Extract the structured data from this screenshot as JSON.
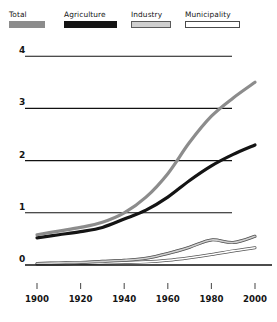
{
  "legend": {
    "items": [
      {
        "label": "Total",
        "swatch": "gray-filled-swatch",
        "color": "#8c8c8c"
      },
      {
        "label": "Agriculture",
        "swatch": "black-filled-swatch",
        "color": "#141414"
      },
      {
        "label": "Industry",
        "swatch": "light-gray-filled-swatch",
        "color": "#cfcfcf"
      },
      {
        "label": "Municipality",
        "swatch": "white-outlined-swatch",
        "color": "#ffffff"
      }
    ]
  },
  "axes": {
    "y_ticks": [
      "0",
      "1",
      "2",
      "3",
      "4"
    ],
    "x_ticks": [
      "1900",
      "1920",
      "1940",
      "1960",
      "1980",
      "2000"
    ]
  },
  "chart_data": {
    "type": "line",
    "title": "",
    "subtitle": "",
    "xlabel": "",
    "ylabel": "",
    "xlim": [
      1900,
      2000
    ],
    "ylim": [
      0,
      4
    ],
    "grid": true,
    "legend_position": "top",
    "x": [
      1900,
      1910,
      1920,
      1930,
      1940,
      1950,
      1960,
      1970,
      1980,
      1990,
      2000
    ],
    "series": [
      {
        "name": "Total",
        "color": "#8c8c8c",
        "values": [
          0.58,
          0.65,
          0.72,
          0.82,
          1.0,
          1.3,
          1.75,
          2.35,
          2.85,
          3.2,
          3.5
        ]
      },
      {
        "name": "Agriculture",
        "color": "#141414",
        "values": [
          0.52,
          0.58,
          0.64,
          0.72,
          0.88,
          1.05,
          1.3,
          1.62,
          1.9,
          2.12,
          2.3
        ]
      },
      {
        "name": "Industry",
        "color": "#cfcfcf",
        "values": [
          0.03,
          0.04,
          0.05,
          0.07,
          0.09,
          0.13,
          0.22,
          0.34,
          0.48,
          0.43,
          0.55
        ]
      },
      {
        "name": "Municipality",
        "color": "#ffffff",
        "values": [
          0.02,
          0.02,
          0.03,
          0.04,
          0.05,
          0.06,
          0.09,
          0.14,
          0.2,
          0.27,
          0.33
        ]
      }
    ]
  }
}
